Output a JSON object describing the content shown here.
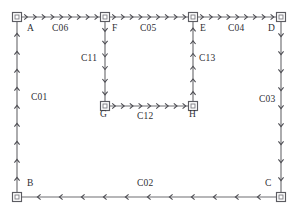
{
  "diagram": {
    "canvas": {
      "width": 299,
      "height": 217
    },
    "colors": {
      "background": "#ffffff",
      "edge_stroke": "#6e6e72",
      "arrow_stroke": "#4a4a50",
      "node_stroke": "#5c5c62",
      "node_fill": "#ffffff",
      "text": "#2e2e33"
    },
    "nodes": [
      {
        "id": "A",
        "label": "A",
        "x": 17,
        "y": 17,
        "label_x": 27,
        "label_y": 24
      },
      {
        "id": "F",
        "label": "F",
        "x": 105,
        "y": 17,
        "label_x": 112,
        "label_y": 24
      },
      {
        "id": "E",
        "label": "E",
        "x": 193,
        "y": 17,
        "label_x": 200,
        "label_y": 24
      },
      {
        "id": "D",
        "label": "D",
        "x": 281,
        "y": 17,
        "label_x": 268,
        "label_y": 24
      },
      {
        "id": "G",
        "label": "G",
        "x": 105,
        "y": 106,
        "label_x": 100,
        "label_y": 110
      },
      {
        "id": "H",
        "label": "H",
        "x": 193,
        "y": 106,
        "label_x": 189,
        "label_y": 110
      },
      {
        "id": "B",
        "label": "B",
        "x": 17,
        "y": 197,
        "label_x": 27,
        "label_y": 179
      },
      {
        "id": "C",
        "label": "C",
        "x": 281,
        "y": 197,
        "label_x": 265,
        "label_y": 179
      }
    ],
    "edges": [
      {
        "id": "C06",
        "label": "C06",
        "from": "A",
        "to": "F",
        "direction": "right",
        "x1": 17,
        "y1": 17,
        "x2": 105,
        "y2": 17,
        "label_x": 52,
        "label_y": 24,
        "arrows": 9
      },
      {
        "id": "C05",
        "label": "C05",
        "from": "F",
        "to": "E",
        "direction": "right",
        "x1": 105,
        "y1": 17,
        "x2": 193,
        "y2": 17,
        "label_x": 140,
        "label_y": 24,
        "arrows": 9
      },
      {
        "id": "C04",
        "label": "C04",
        "from": "E",
        "to": "D",
        "direction": "right",
        "x1": 193,
        "y1": 17,
        "x2": 281,
        "y2": 17,
        "label_x": 228,
        "label_y": 24,
        "arrows": 9
      },
      {
        "id": "C03",
        "label": "C03",
        "from": "D",
        "to": "C",
        "direction": "down",
        "x1": 281,
        "y1": 17,
        "x2": 281,
        "y2": 197,
        "label_x": 259,
        "label_y": 95,
        "arrows": 9
      },
      {
        "id": "C02",
        "label": "C02",
        "from": "C",
        "to": "B",
        "direction": "left",
        "x1": 281,
        "y1": 197,
        "x2": 17,
        "y2": 197,
        "label_x": 137,
        "label_y": 179,
        "arrows": 11
      },
      {
        "id": "C01",
        "label": "C01",
        "from": "B",
        "to": "A",
        "direction": "up",
        "x1": 17,
        "y1": 197,
        "x2": 17,
        "y2": 17,
        "label_x": 31,
        "label_y": 93,
        "arrows": 9
      },
      {
        "id": "C11",
        "label": "C11",
        "from": "F",
        "to": "G",
        "direction": "down",
        "x1": 105,
        "y1": 17,
        "x2": 105,
        "y2": 106,
        "label_x": 81,
        "label_y": 54,
        "arrows": 6
      },
      {
        "id": "C12",
        "label": "C12",
        "from": "G",
        "to": "H",
        "direction": "right",
        "x1": 105,
        "y1": 106,
        "x2": 193,
        "y2": 106,
        "label_x": 137,
        "label_y": 112,
        "arrows": 9
      },
      {
        "id": "C13",
        "label": "C13",
        "from": "H",
        "to": "E",
        "direction": "up",
        "x1": 193,
        "y1": 106,
        "x2": 193,
        "y2": 17,
        "label_x": 199,
        "label_y": 54,
        "arrows": 6
      }
    ],
    "node_marker": {
      "outer_size": 9,
      "inner_size": 4
    },
    "legend": {
      "node_count": 8,
      "edge_count": 9
    }
  }
}
